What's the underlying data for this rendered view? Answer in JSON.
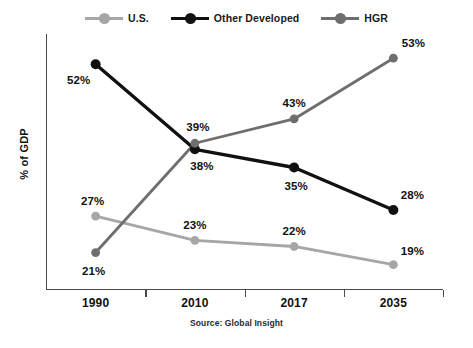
{
  "chart_data": {
    "type": "line",
    "title": "",
    "xlabel": "",
    "ylabel": "% of GDP",
    "categories": [
      "1990",
      "2010",
      "2017",
      "2035"
    ],
    "ylim": [
      15,
      56
    ],
    "grid": false,
    "legend_position": "top-center",
    "source_note": "Source: Global Insight",
    "series": [
      {
        "name": "U.S.",
        "color": "#a6a6a6",
        "values": [
          27,
          23,
          22,
          19
        ],
        "labels": [
          "27%",
          "23%",
          "22%",
          "19%"
        ]
      },
      {
        "name": "Other Developed",
        "color": "#111111",
        "values": [
          52,
          38,
          35,
          28
        ],
        "labels": [
          "52%",
          "38%",
          "35%",
          "28%"
        ]
      },
      {
        "name": "HGR",
        "color": "#6e6e6e",
        "values": [
          21,
          39,
          43,
          53
        ],
        "labels": [
          "21%",
          "39%",
          "43%",
          "53%"
        ]
      }
    ]
  },
  "legend": {
    "items": [
      {
        "label": "U.S.",
        "color": "#a6a6a6"
      },
      {
        "label": "Other Developed",
        "color": "#111111"
      },
      {
        "label": "HGR",
        "color": "#6e6e6e"
      }
    ]
  },
  "axes": {
    "y_title": "% of GDP",
    "x_ticks": [
      "1990",
      "2010",
      "2017",
      "2035"
    ]
  },
  "footer": {
    "source": "Source: Global Insight"
  }
}
